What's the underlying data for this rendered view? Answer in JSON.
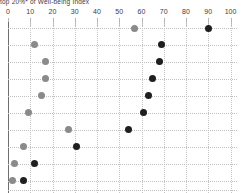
{
  "page": {
    "title": "top 20%* of Well-being Index"
  },
  "chart_data": {
    "type": "scatter",
    "subtype": "dumbbell-dot-plot",
    "title": "top 20%* of Well-being Index",
    "xlabel": "",
    "ylabel": "",
    "x_axis": {
      "min": 0,
      "max": 100,
      "ticks": [
        0,
        10,
        20,
        30,
        40,
        50,
        60,
        70,
        80,
        90,
        100
      ],
      "position": "top"
    },
    "grid": true,
    "legend": "none",
    "row_count": 10,
    "categories": [
      "",
      "",
      "",
      "",
      "",
      "",
      "",
      "",
      "",
      ""
    ],
    "series": [
      {
        "name": "series-gray",
        "color": "#8a8a8a",
        "values": [
          57,
          12,
          17,
          17,
          15,
          9,
          27,
          7,
          3,
          2
        ]
      },
      {
        "name": "series-black",
        "color": "#1f1f1f",
        "values": [
          90,
          69,
          68,
          65,
          63,
          61,
          54,
          31,
          12,
          7
        ]
      }
    ]
  }
}
